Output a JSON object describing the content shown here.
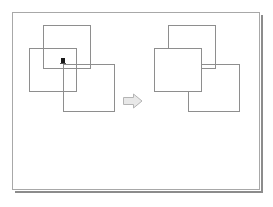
{
  "figure": {
    "background_color": "#ffffff",
    "frame_border_color": "#a8a8a8",
    "frame_shadow_color": "#8c8c8c",
    "shape_stroke_color": "#8e8e8e",
    "arrow_fill_color": "#e8e8e8",
    "arrow_stroke_color": "#b4b4b4",
    "marker_color": "#1a1a1a"
  },
  "panels": [
    {
      "id": "before",
      "name": "before-state",
      "label": "",
      "shapes": [
        {
          "id": "rect-a",
          "name": "rectangle-a",
          "x": 14,
          "y": 6,
          "width": 48,
          "height": 44,
          "z": 2
        },
        {
          "id": "rect-b",
          "name": "rectangle-b",
          "x": 0,
          "y": 29,
          "width": 48,
          "height": 44,
          "z": 1
        },
        {
          "id": "rect-c",
          "name": "rectangle-c",
          "x": 34,
          "y": 45,
          "width": 52,
          "height": 48,
          "z": 3
        }
      ],
      "marker": {
        "name": "pointer-marker",
        "x": 32,
        "y": 39
      }
    },
    {
      "id": "after",
      "name": "after-state",
      "label": "",
      "shapes": [
        {
          "id": "rect-a",
          "name": "rectangle-a",
          "x": 14,
          "y": 6,
          "width": 48,
          "height": 44,
          "z": 1
        },
        {
          "id": "rect-b",
          "name": "rectangle-b",
          "x": 0,
          "y": 29,
          "width": 48,
          "height": 44,
          "z": 3
        },
        {
          "id": "rect-c",
          "name": "rectangle-c",
          "x": 34,
          "y": 45,
          "width": 52,
          "height": 48,
          "z": 2
        }
      ],
      "marker": null
    }
  ],
  "arrow": {
    "name": "transition-arrow",
    "direction": "right",
    "label": ""
  }
}
